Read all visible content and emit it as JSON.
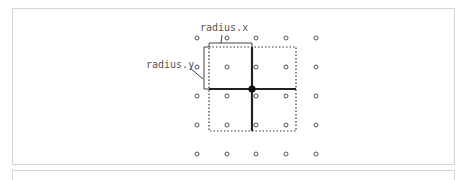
{
  "diagram": {
    "labels": {
      "radius_x": "radius.x",
      "radius_y": "radius.y"
    },
    "grid": {
      "columns_x": [
        197,
        227,
        256,
        286,
        316
      ],
      "rows_y": [
        38,
        67,
        96,
        125,
        154
      ],
      "dot_color": "#555555"
    },
    "kernel": {
      "center": [
        252,
        89
      ],
      "left": 209,
      "right": 296,
      "top": 47,
      "bottom": 131,
      "line_color": "#222222"
    }
  }
}
